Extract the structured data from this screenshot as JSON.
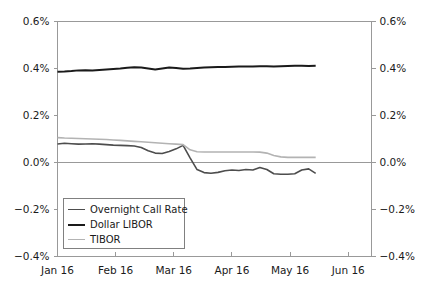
{
  "chart_data": {
    "type": "line",
    "title": "",
    "xlabel": "",
    "ylabel": "",
    "ylim": [
      -0.4,
      0.6
    ],
    "xlim": [
      0,
      5.4
    ],
    "grid": false,
    "zero_line": true,
    "legend_position": "lower-left",
    "y_ticks": [
      "0.6%",
      "0.4%",
      "0.2%",
      "0.0%",
      "-0.2%",
      "-0.4%"
    ],
    "y_tick_values": [
      0.6,
      0.4,
      0.2,
      0.0,
      -0.2,
      -0.4
    ],
    "y_axis_left": [
      "0.6%",
      "0.4%",
      "0.2%",
      "0.0%",
      "-0.2%",
      "-0.4%"
    ],
    "y_axis_right": [
      "0.6%",
      "0.4%",
      "0.2%",
      "0.0%",
      "-0.2%",
      "-0.4%"
    ],
    "x_ticks": [
      "Jan 16",
      "Feb 16",
      "Mar 16",
      "Apr 16",
      "May 16",
      "Jun 16"
    ],
    "x_tick_values": [
      0,
      1,
      2,
      3,
      4,
      5
    ],
    "series": [
      {
        "name": "Overnight Call Rate",
        "color": "#4d4d4d",
        "width": 1.6,
        "x": [
          0.0,
          0.12,
          0.24,
          0.36,
          0.48,
          0.6,
          0.72,
          0.84,
          0.96,
          1.08,
          1.2,
          1.32,
          1.44,
          1.56,
          1.68,
          1.8,
          1.92,
          2.04,
          2.16,
          2.28,
          2.4,
          2.52,
          2.64,
          2.76,
          2.88,
          3.0,
          3.12,
          3.24,
          3.36,
          3.48,
          3.6,
          3.72,
          3.84,
          3.96,
          4.08,
          4.2,
          4.32,
          4.44
        ],
        "y": [
          0.079,
          0.082,
          0.08,
          0.078,
          0.079,
          0.08,
          0.078,
          0.076,
          0.074,
          0.073,
          0.072,
          0.07,
          0.064,
          0.05,
          0.04,
          0.038,
          0.047,
          0.058,
          0.073,
          0.02,
          -0.03,
          -0.043,
          -0.046,
          -0.042,
          -0.035,
          -0.032,
          -0.034,
          -0.03,
          -0.032,
          -0.021,
          -0.03,
          -0.048,
          -0.05,
          -0.05,
          -0.048,
          -0.032,
          -0.027,
          -0.046
        ]
      },
      {
        "name": "Dollar LIBOR",
        "color": "#1a1a1a",
        "width": 2.0,
        "x": [
          0.0,
          0.12,
          0.24,
          0.36,
          0.48,
          0.6,
          0.72,
          0.84,
          0.96,
          1.08,
          1.2,
          1.32,
          1.44,
          1.56,
          1.68,
          1.8,
          1.92,
          2.04,
          2.16,
          2.28,
          2.4,
          2.52,
          2.64,
          2.76,
          2.88,
          3.0,
          3.12,
          3.24,
          3.36,
          3.48,
          3.6,
          3.72,
          3.84,
          3.96,
          4.08,
          4.2,
          4.32,
          4.44
        ],
        "y": [
          0.386,
          0.387,
          0.389,
          0.392,
          0.393,
          0.392,
          0.394,
          0.396,
          0.398,
          0.4,
          0.403,
          0.405,
          0.404,
          0.4,
          0.396,
          0.4,
          0.404,
          0.402,
          0.399,
          0.4,
          0.402,
          0.404,
          0.405,
          0.406,
          0.406,
          0.407,
          0.408,
          0.408,
          0.409,
          0.41,
          0.41,
          0.409,
          0.41,
          0.411,
          0.412,
          0.412,
          0.411,
          0.412
        ]
      },
      {
        "name": "TIBOR",
        "color": "#b3b3b3",
        "width": 1.6,
        "x": [
          0.0,
          0.12,
          0.24,
          0.36,
          0.48,
          0.6,
          0.72,
          0.84,
          0.96,
          1.08,
          1.2,
          1.32,
          1.44,
          1.56,
          1.68,
          1.8,
          1.92,
          2.04,
          2.16,
          2.28,
          2.4,
          2.52,
          2.64,
          2.76,
          2.88,
          3.0,
          3.12,
          3.24,
          3.36,
          3.48,
          3.6,
          3.72,
          3.84,
          3.96,
          4.08,
          4.2,
          4.32,
          4.44
        ],
        "y": [
          0.106,
          0.104,
          0.103,
          0.102,
          0.101,
          0.1,
          0.099,
          0.098,
          0.096,
          0.094,
          0.092,
          0.09,
          0.088,
          0.086,
          0.084,
          0.082,
          0.08,
          0.078,
          0.076,
          0.054,
          0.046,
          0.045,
          0.045,
          0.045,
          0.045,
          0.045,
          0.045,
          0.045,
          0.045,
          0.044,
          0.04,
          0.03,
          0.024,
          0.022,
          0.022,
          0.022,
          0.022,
          0.022
        ]
      }
    ]
  },
  "legend": {
    "items": [
      {
        "label": "Overnight Call Rate",
        "color": "#4d4d4d",
        "width": 1.6
      },
      {
        "label": "Dollar LIBOR",
        "color": "#1a1a1a",
        "width": 2.2
      },
      {
        "label": "TIBOR",
        "color": "#b3b3b3",
        "width": 1.6
      }
    ]
  },
  "colors": {
    "axis": "#999999",
    "zero_line": "#999999",
    "text": "#1a1a1a",
    "background": "#ffffff"
  }
}
